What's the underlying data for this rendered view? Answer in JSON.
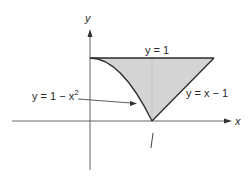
{
  "figure": {
    "axes": {
      "x_label": "x",
      "y_label": "y"
    },
    "curves": [
      {
        "id": "horizontal-line",
        "label": "y = 1"
      },
      {
        "id": "parabola",
        "label_prefix": "y = 1 − x",
        "label_exp": "2"
      },
      {
        "id": "line",
        "label": "y = x − 1"
      }
    ],
    "tick_label": "1",
    "region": {
      "description": "Shaded region bounded by y = 1, y = 1 − x², and y = x − 1",
      "fill_color": "#d4d4d4"
    },
    "colors": {
      "stroke": "#2a2a2a",
      "axis": "#555555",
      "fill": "#d4d4d4"
    }
  }
}
